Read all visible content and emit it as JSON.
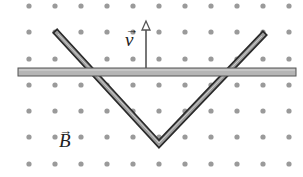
{
  "figure": {
    "colors": {
      "background": "#ffffff",
      "dot": "#9a9a9a",
      "rail_fill": "#9e9e9e",
      "rail_edge": "#2a2a2a",
      "bar_fill": "#b5b5b5",
      "bar_edge": "#555555",
      "arrow": "#555555"
    },
    "field_dots": {
      "symbol": "dot (field out of page)",
      "x_positions": [
        29,
        55,
        81,
        107,
        133,
        159,
        185,
        211,
        237,
        263,
        289
      ],
      "y_positions": [
        6,
        32,
        59,
        85,
        111,
        137,
        164
      ],
      "radius": 2.6
    },
    "rails": {
      "left_arm": {
        "x1": 57,
        "y1": 33,
        "x2": 159,
        "y2": 144
      },
      "right_arm": {
        "x1": 159,
        "y1": 144,
        "x2": 263,
        "y2": 35
      }
    },
    "sliding_bar": {
      "x": 18,
      "y": 68,
      "width": 278,
      "height": 8
    },
    "velocity_arrow": {
      "x": 146,
      "y_start": 68,
      "y_end": 21,
      "direction": "up"
    }
  },
  "labels": {
    "velocity": "v",
    "field": "B",
    "vector_mark": "→"
  }
}
